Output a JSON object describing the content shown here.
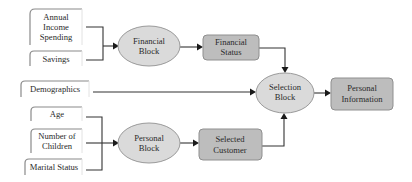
{
  "diagram": {
    "inputs": {
      "annual_income_spending": [
        "Annual",
        "Income",
        "Spending"
      ],
      "savings": [
        "Savings"
      ],
      "demographics": [
        "Demographics"
      ],
      "age": [
        "Age"
      ],
      "number_of_children": [
        "Number of",
        "Children"
      ],
      "marital_status": [
        "Marital Status"
      ]
    },
    "processes": {
      "financial_block": [
        "Financial",
        "Block"
      ],
      "personal_block": [
        "Personal",
        "Block"
      ],
      "selection_block": [
        "Selection",
        "Block"
      ]
    },
    "outputs": {
      "financial_status": [
        "Financial",
        "Status"
      ],
      "selected_customer": [
        "Selected",
        "Customer"
      ],
      "personal_information": [
        "Personal",
        "Information"
      ]
    },
    "edges": [
      {
        "from": "Annual Income Spending",
        "to": "Financial Block"
      },
      {
        "from": "Savings",
        "to": "Financial Block"
      },
      {
        "from": "Financial Block",
        "to": "Financial Status"
      },
      {
        "from": "Financial Status",
        "to": "Selection Block"
      },
      {
        "from": "Demographics",
        "to": "Selection Block"
      },
      {
        "from": "Age",
        "to": "Personal Block"
      },
      {
        "from": "Number of Children",
        "to": "Personal Block"
      },
      {
        "from": "Marital Status",
        "to": "Personal Block"
      },
      {
        "from": "Personal Block",
        "to": "Selected Customer"
      },
      {
        "from": "Selected Customer",
        "to": "Selection Block"
      },
      {
        "from": "Selection Block",
        "to": "Personal Information"
      }
    ],
    "colors": {
      "ellipse_fill": "#dadada",
      "rect_fill": "#bdbdbd",
      "line": "#333333"
    }
  }
}
